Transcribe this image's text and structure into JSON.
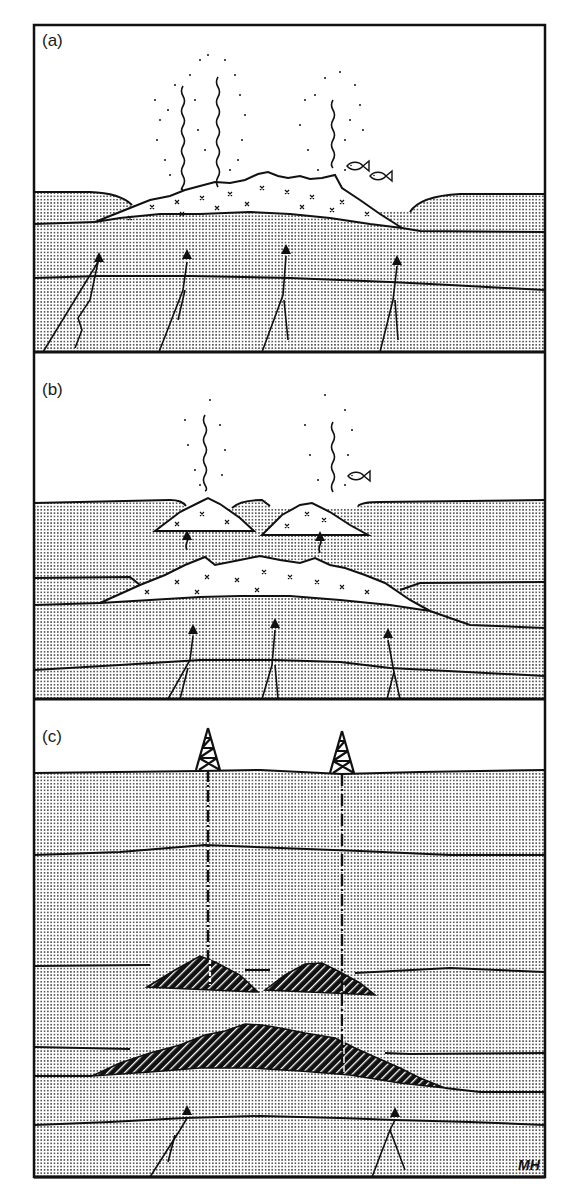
{
  "figure": {
    "panels": [
      {
        "id": "a",
        "label": "(a)",
        "elements": [
          "hydrothermal-plumes",
          "fish",
          "seafloor-sulfide-mound",
          "sediment-layers",
          "faults-with-fluid-arrows"
        ],
        "plume_count": 3,
        "fish_count": 2,
        "fault_arrow_count": 4
      },
      {
        "id": "b",
        "label": "(b)",
        "elements": [
          "hydrothermal-plumes",
          "fish",
          "new-seafloor-mounds",
          "buried-mound",
          "upward-fluid-arrows",
          "faults-with-fluid-arrows"
        ],
        "plume_count": 2,
        "fish_count": 1,
        "fault_arrow_count": 3
      },
      {
        "id": "c",
        "label": "(c)",
        "elements": [
          "drilling-rigs",
          "drill-strings",
          "buried-ore-lenses",
          "buried-ore-body",
          "sediment-layers",
          "faults-with-fluid-arrows"
        ],
        "rig_count": 2,
        "fault_arrow_count": 2
      }
    ],
    "signature": "MH",
    "colors": {
      "ink": "#111111",
      "sediment_dot": "#3a3a3a",
      "background": "#ffffff",
      "ore_fill": "#111111"
    }
  }
}
